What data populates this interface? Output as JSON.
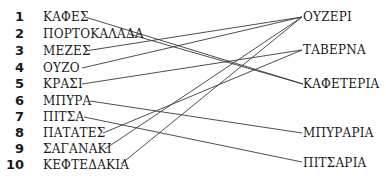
{
  "left_items": [
    {
      "num": "1",
      "label": "ΚΑΦΕΣ"
    },
    {
      "num": "2",
      "label": "ΠΟΡΤΟΚΑΛΑΔΑ"
    },
    {
      "num": "3",
      "label": "ΜΕΖΕΣ"
    },
    {
      "num": "4",
      "label": "ΟΥΖΟ"
    },
    {
      "num": "5",
      "label": "ΚΡΑΣΙ"
    },
    {
      "num": "6",
      "label": "ΜΠΥΡΑ"
    },
    {
      "num": "7",
      "label": "ΠΙΤΣΑ"
    },
    {
      "num": "8",
      "label": "ΠΑΤΑΤΕΣ"
    },
    {
      "num": "9",
      "label": "ΣΑΓΑΝΑΚΙ"
    },
    {
      "num": "10",
      "label": "ΚΕΦΤΕΔΑΚΙΑ"
    }
  ],
  "right_items": [
    {
      "label": "ΟΥΖΕΡΙ"
    },
    {
      "label": "ΤΑΒΕΡΝΑ"
    },
    {
      "label": "ΚΑΦΕΤΕΡΙΑ"
    },
    {
      "label": "ΜΠΥΡΑΡΙΑ"
    },
    {
      "label": "ΠΙΤΣΑΡΙΑ"
    }
  ],
  "line_color": "#333333"
}
